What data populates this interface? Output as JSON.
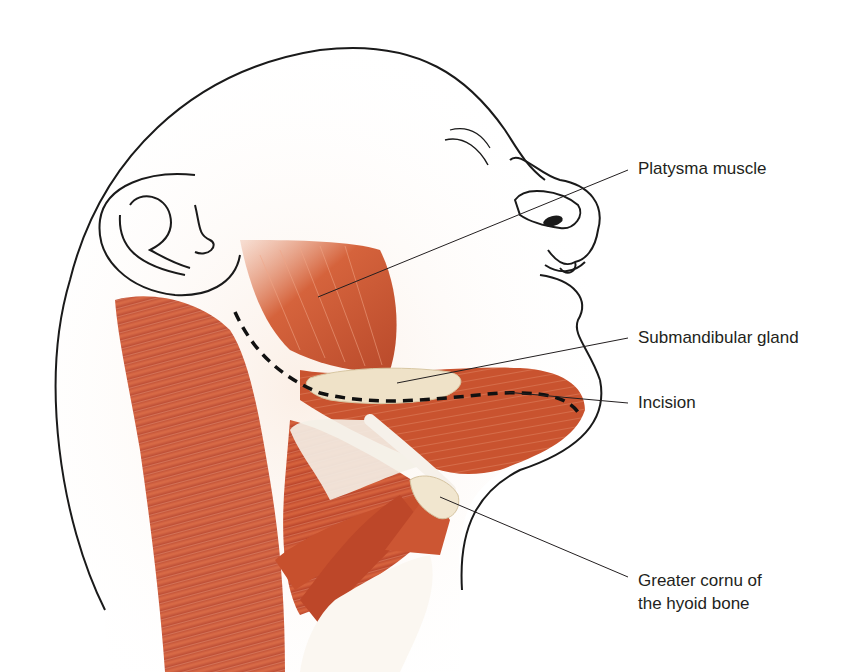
{
  "figure": {
    "colors": {
      "outline": "#1a1a1a",
      "muscle": "#c8502e",
      "muscle_light": "#e08a66",
      "tendon": "#f3ece2",
      "gland": "#efe2c8",
      "bone": "#f1e6cf",
      "skin": "#fffdf9",
      "leader_line": "#231f20",
      "incision": "#111111"
    }
  },
  "labels": [
    {
      "id": "platysma",
      "text": "Platysma muscle"
    },
    {
      "id": "submandibular",
      "text": "Submandibular gland"
    },
    {
      "id": "incision",
      "text": "Incision"
    },
    {
      "id": "hyoid_line1",
      "text": "Greater cornu of"
    },
    {
      "id": "hyoid_line2",
      "text": "the hyoid bone"
    }
  ]
}
